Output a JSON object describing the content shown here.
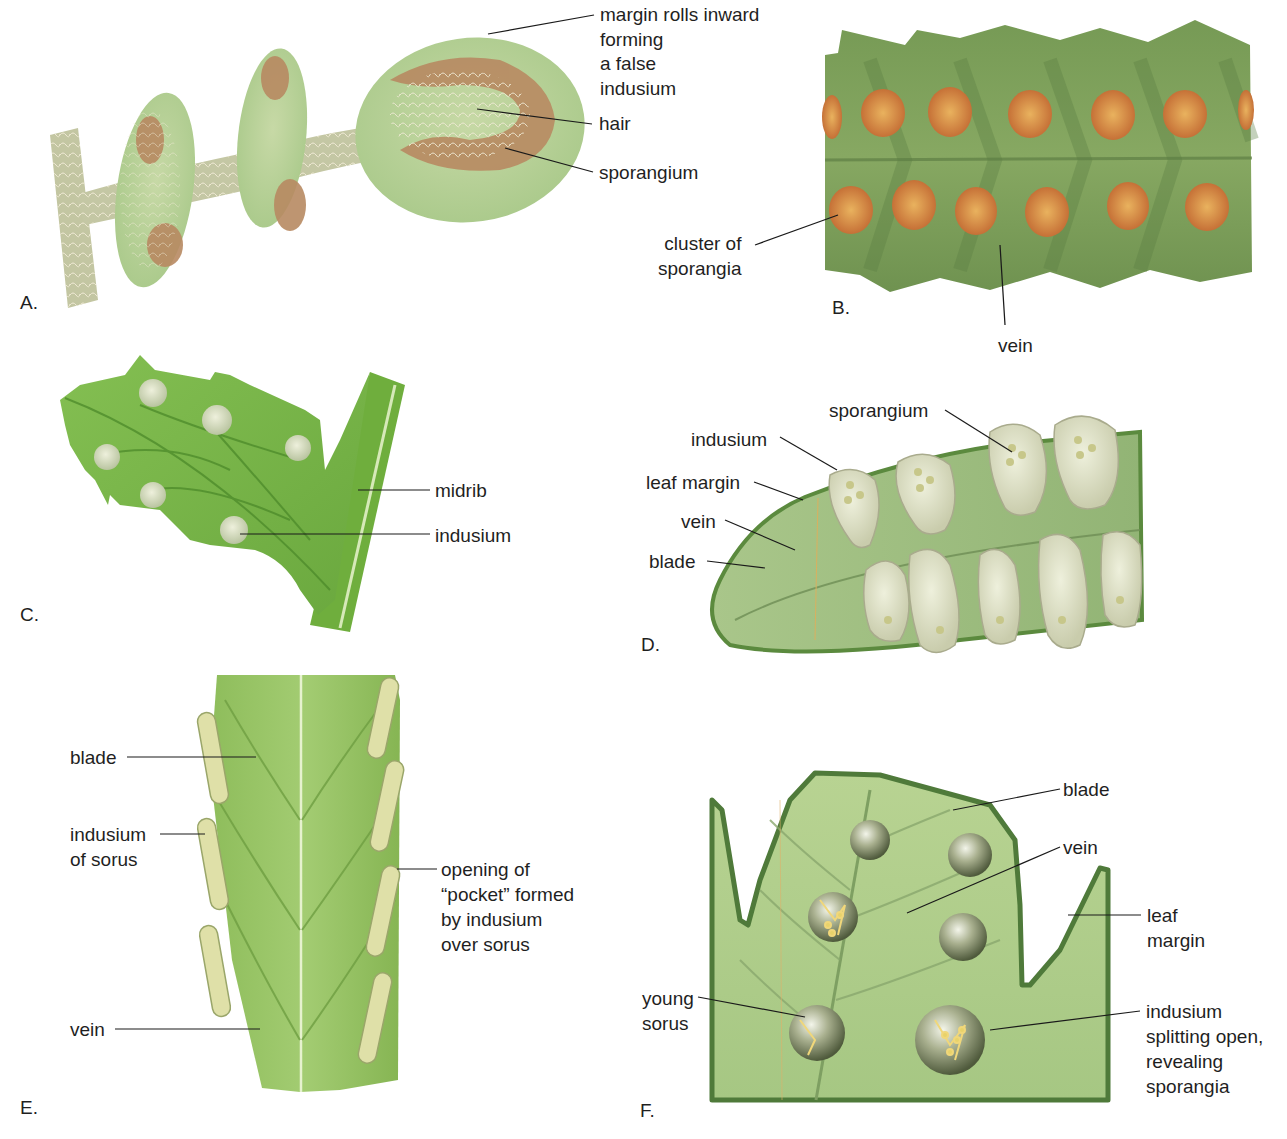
{
  "figure": {
    "colors": {
      "leaf_light": "#b9d39a",
      "leaf_mid": "#8fbf5e",
      "leaf_bright": "#7ab648",
      "leaf_dark": "#6f9250",
      "leaf_margin": "#4f7a3a",
      "sorus_orange": "#c8743a",
      "sorus_yellow": "#e9b25e",
      "hair": "#ece6cf",
      "indusium_cream": "#dfe1c6",
      "sorus_ball": "#7f8a66",
      "leader_line": "#1a1a1a"
    },
    "panels": {
      "A": {
        "letter": "A.",
        "labels": {
          "margin": "margin rolls inward\nforming\na false\nindusium",
          "hair": "hair",
          "sporangium": "sporangium"
        }
      },
      "B": {
        "letter": "B.",
        "labels": {
          "cluster": "cluster of\nsporangia",
          "vein": "vein"
        }
      },
      "C": {
        "letter": "C.",
        "labels": {
          "midrib": "midrib",
          "indusium": "indusium"
        }
      },
      "D": {
        "letter": "D.",
        "labels": {
          "sporangium": "sporangium",
          "indusium": "indusium",
          "leaf_margin": "leaf margin",
          "vein": "vein",
          "blade": "blade"
        }
      },
      "E": {
        "letter": "E.",
        "labels": {
          "blade": "blade",
          "indusium": "indusium\nof sorus",
          "opening": "opening of\n“pocket” formed\nby indusium\nover sorus",
          "vein": "vein"
        }
      },
      "F": {
        "letter": "F.",
        "labels": {
          "blade": "blade",
          "vein": "vein",
          "leaf_margin": "leaf\nmargin",
          "young_sorus": "young\nsorus",
          "indusium_splitting": "indusium\nsplitting open,\nrevealing\nsporangia"
        }
      }
    }
  }
}
